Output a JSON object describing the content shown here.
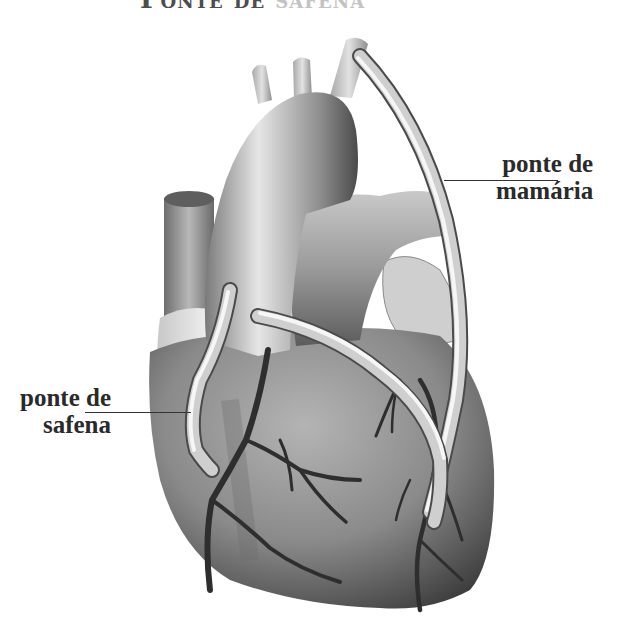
{
  "title": {
    "text_main": "Ponte de",
    "text_faded": "safena",
    "cropped": true
  },
  "labels": {
    "mamaria": {
      "line1": "ponte de",
      "line2": "mamária"
    },
    "safena": {
      "line1": "ponte de",
      "line2": "safena"
    }
  },
  "figure": {
    "style": "grayscale-illustration",
    "colors": {
      "background": "#ffffff",
      "text": "#2a2a2a",
      "graft_light": "#f2f2f2",
      "graft_dark": "#5a5a5a",
      "tissue_dark": "#4a4a4a",
      "tissue_light": "#d8d8d8",
      "vessel": "#2e2e2e"
    }
  }
}
